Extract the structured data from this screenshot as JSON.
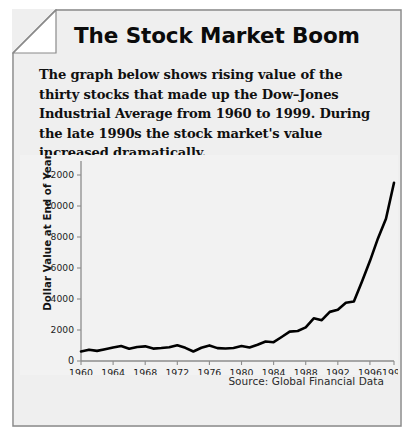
{
  "card": {
    "title": "The Stock Market Boom",
    "blurb": "The graph below shows rising value of the thirty stocks that made up the Dow–Jones Industrial Average from 1960 to 1999. During the late 1990s the stock market's value increased dramatically.",
    "source": "Source: Global Financial Data",
    "background_color": "#efefef",
    "border_color": "#8a8a8a",
    "folded_corner": true
  },
  "chart_data": {
    "type": "line",
    "title": "",
    "xlabel": "",
    "ylabel": "Dollar Value at End of Year",
    "line_color": "#000000",
    "plot_background": "#f2f2f2",
    "grid": false,
    "legend": null,
    "xlim": [
      1960,
      1999
    ],
    "ylim": [
      0,
      12000
    ],
    "ytick_labels": [
      "0",
      "2000",
      "4000",
      "6000",
      "8000",
      "10000",
      "12000"
    ],
    "yticks": [
      0,
      2000,
      4000,
      6000,
      8000,
      10000,
      12000
    ],
    "xtick_labels": [
      "1960",
      "1964",
      "1968",
      "1972",
      "1976",
      "1980",
      "1984",
      "1988",
      "1992",
      "1996",
      "1999"
    ],
    "xticks": [
      1960,
      1964,
      1968,
      1972,
      1976,
      1980,
      1984,
      1988,
      1992,
      1996,
      1999
    ],
    "x": [
      1960,
      1961,
      1962,
      1963,
      1964,
      1965,
      1966,
      1967,
      1968,
      1969,
      1970,
      1971,
      1972,
      1973,
      1974,
      1975,
      1976,
      1977,
      1978,
      1979,
      1980,
      1981,
      1982,
      1983,
      1984,
      1985,
      1986,
      1987,
      1988,
      1989,
      1990,
      1991,
      1992,
      1993,
      1994,
      1995,
      1996,
      1997,
      1998,
      1999
    ],
    "values": [
      616,
      731,
      652,
      763,
      874,
      969,
      786,
      905,
      944,
      800,
      839,
      890,
      1020,
      851,
      616,
      852,
      1005,
      831,
      805,
      839,
      964,
      875,
      1047,
      1259,
      1212,
      1547,
      1896,
      1939,
      2169,
      2753,
      2634,
      3169,
      3301,
      3754,
      3834,
      5117,
      6448,
      7908,
      9181,
      11497
    ],
    "series_name": "Dow–Jones Industrial Average"
  }
}
